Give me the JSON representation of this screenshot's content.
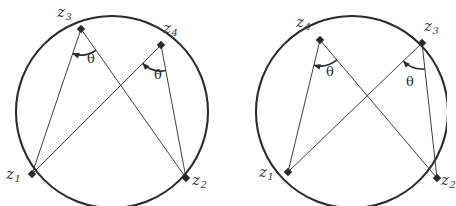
{
  "figure": {
    "kind": "geometry-diagram",
    "ink_color": "#2b2b2b",
    "label_color": "#3a3a3a",
    "background": "#ffffff",
    "angle_symbol": "θ"
  },
  "panels": [
    {
      "id": "left",
      "circle": {
        "cx": 112,
        "cy": 112,
        "r": 96
      },
      "points": [
        {
          "name": "z1",
          "base": "z",
          "sub": "1",
          "x": 32,
          "y": 174,
          "label_x": 6,
          "label_y": 166
        },
        {
          "name": "z2",
          "base": "z",
          "sub": "2",
          "x": 186,
          "y": 178,
          "label_x": 192,
          "label_y": 172
        },
        {
          "name": "z3",
          "base": "z",
          "sub": "3",
          "x": 81,
          "y": 29,
          "label_x": 57,
          "label_y": 4
        },
        {
          "name": "z4",
          "base": "z",
          "sub": "4",
          "x": 161,
          "y": 45,
          "label_x": 163,
          "label_y": 20
        }
      ],
      "chords": [
        {
          "from": "z3",
          "to": "z1"
        },
        {
          "from": "z3",
          "to": "z2"
        },
        {
          "from": "z4",
          "to": "z1"
        },
        {
          "from": "z4",
          "to": "z2"
        }
      ],
      "angles": [
        {
          "at": "z3",
          "symbol": "θ",
          "label_x": 87,
          "label_y": 52
        },
        {
          "at": "z4",
          "symbol": "θ",
          "label_x": 154,
          "label_y": 68
        }
      ]
    },
    {
      "id": "right",
      "circle": {
        "cx": 352,
        "cy": 112,
        "r": 96
      },
      "points": [
        {
          "name": "z1",
          "base": "z",
          "sub": "1",
          "x": 288,
          "y": 172,
          "label_x": 259,
          "label_y": 164
        },
        {
          "name": "z2",
          "base": "z",
          "sub": "2",
          "x": 437,
          "y": 178,
          "label_x": 441,
          "label_y": 172
        },
        {
          "name": "z4",
          "base": "z",
          "sub": "4",
          "x": 320,
          "y": 40,
          "label_x": 296,
          "label_y": 14
        },
        {
          "name": "z3",
          "base": "z",
          "sub": "3",
          "x": 422,
          "y": 43,
          "label_x": 424,
          "label_y": 18
        }
      ],
      "chords": [
        {
          "from": "z4",
          "to": "z1"
        },
        {
          "from": "z4",
          "to": "z2"
        },
        {
          "from": "z3",
          "to": "z1"
        },
        {
          "from": "z3",
          "to": "z2"
        }
      ],
      "angles": [
        {
          "at": "z4",
          "symbol": "θ",
          "label_x": 326,
          "label_y": 65
        },
        {
          "at": "z3",
          "symbol": "θ",
          "label_x": 406,
          "label_y": 75
        }
      ]
    }
  ]
}
